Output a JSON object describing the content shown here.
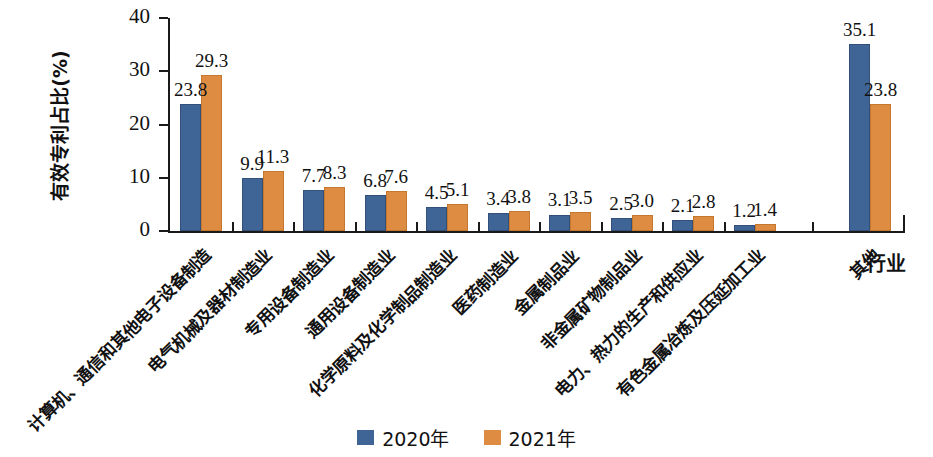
{
  "chart_data": {
    "type": "bar",
    "title": "",
    "xlabel": "行业",
    "ylabel": "有效专利占比(%)",
    "ylim": [
      0,
      40
    ],
    "ytick_labels": [
      "0",
      "10",
      "20",
      "30",
      "40"
    ],
    "yticks": [
      0,
      10,
      20,
      30,
      40
    ],
    "grid": false,
    "legend_position": "bottom-center",
    "categories": [
      "计算机、通信和其他电子设备制造",
      "电气机械及器材制造业",
      "专用设备制造业",
      "通用设备制造业",
      "化学原料及化学制品制造业",
      "医药制造业",
      "金属制品业",
      "非金属矿物制品业",
      "电力、热力的生产和供应业",
      "有色金属冶炼及压延加工业",
      "其他"
    ],
    "series": [
      {
        "name": "2020年",
        "color": "#3f6597",
        "values": [
          23.8,
          9.9,
          7.7,
          6.8,
          4.5,
          3.4,
          3.1,
          2.5,
          2.1,
          1.2,
          35.1
        ],
        "labels": [
          "23.8",
          "9.9",
          "7.7",
          "6.8",
          "4.5",
          "3.4",
          "3.1",
          "2.5",
          "2.1",
          "1.2",
          "35.1"
        ]
      },
      {
        "name": "2021年",
        "color": "#dd8c42",
        "values": [
          29.3,
          11.3,
          8.3,
          7.6,
          5.1,
          3.8,
          3.5,
          3.0,
          2.8,
          1.4,
          23.8
        ],
        "labels": [
          "29.3",
          "11.3",
          "8.3",
          "7.6",
          "5.1",
          "3.8",
          "3.5",
          "3.0",
          "2.8",
          "1.4",
          "23.8"
        ]
      }
    ]
  },
  "legend": {
    "items": [
      {
        "label": "2020年",
        "color": "#3f6597"
      },
      {
        "label": "2021年",
        "color": "#dd8c42"
      }
    ]
  },
  "axes": {
    "y_title": "有效专利占比(%)",
    "x_title": "行业",
    "y_ticks": [
      "0",
      "10",
      "20",
      "30",
      "40"
    ]
  }
}
